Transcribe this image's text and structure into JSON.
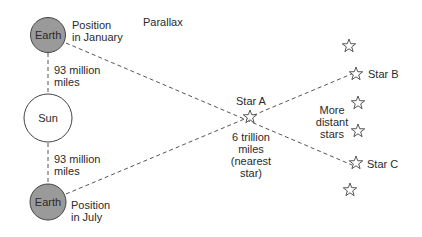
{
  "title": "Parallax",
  "earth_january": {
    "label": "Earth",
    "caption_line1": "Position",
    "caption_line2": "in January"
  },
  "earth_july": {
    "label": "Earth",
    "caption_line1": "Position",
    "caption_line2": "in July"
  },
  "sun": {
    "label": "Sun"
  },
  "distance_top": {
    "line1": "93 million",
    "line2": "miles"
  },
  "distance_bottom": {
    "line1": "93 million",
    "line2": "miles"
  },
  "star_a": {
    "label": "Star A",
    "note_line1": "6 trillion",
    "note_line2": "miles",
    "note_line3": "(nearest",
    "note_line4": "star)"
  },
  "star_b": {
    "label": "Star B"
  },
  "star_c": {
    "label": "Star C"
  },
  "distant_stars": {
    "line1": "More",
    "line2": "distant",
    "line3": "stars"
  },
  "colors": {
    "earth_fill": "#9a9a9a",
    "sun_fill": "#ffffff",
    "stroke": "#444444"
  }
}
